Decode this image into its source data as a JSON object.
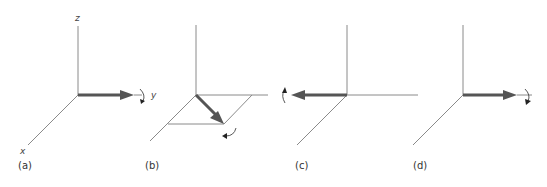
{
  "figure": {
    "panels": [
      {
        "label": "(a)",
        "axis_labels": {
          "z": "z",
          "y": "y",
          "x": "x"
        },
        "vector": "along +y",
        "rotation": "around y axis"
      },
      {
        "label": "(b)",
        "vector": "in x-y plane, diagonal",
        "rotation": "around diagonal vector"
      },
      {
        "label": "(c)",
        "vector": "along -y",
        "rotation": "around -y axis"
      },
      {
        "label": "(d)",
        "vector": "along +y",
        "rotation": "around y axis"
      }
    ]
  },
  "colors": {
    "axis": "#8a8a8a",
    "vector": "#555555"
  }
}
